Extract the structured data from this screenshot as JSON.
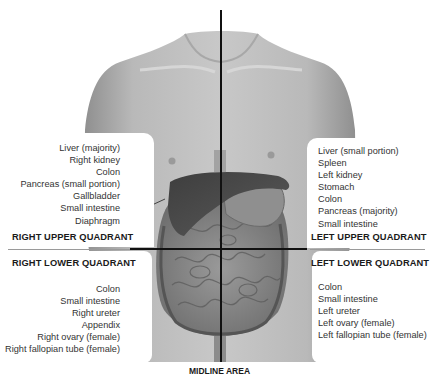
{
  "diagram": {
    "quadrants": [
      {
        "id": "right-upper",
        "title": "RIGHT UPPER QUADRANT",
        "organs": [
          "Liver (majority)",
          "Right kidney",
          "Colon",
          "Pancreas (small portion)",
          "Gallbladder",
          "Small intestine",
          "Diaphragm"
        ]
      },
      {
        "id": "left-upper",
        "title": "LEFT UPPER QUADRANT",
        "organs": [
          "Liver (small portion)",
          "Spleen",
          "Left kidney",
          "Stomach",
          "Colon",
          "Pancreas (majority)",
          "Small intestine"
        ]
      },
      {
        "id": "right-lower",
        "title": "RIGHT LOWER QUADRANT",
        "organs": [
          "Colon",
          "Small intestine",
          "Right ureter",
          "Appendix",
          "Right ovary (female)",
          "Right fallopian tube (female)"
        ]
      },
      {
        "id": "left-lower",
        "title": "LEFT LOWER QUADRANT",
        "organs": [
          "Colon",
          "Small intestine",
          "Left ureter",
          "Left ovary (female)",
          "Left fallopian tube (female)"
        ]
      }
    ],
    "midline_label": "MIDLINE AREA",
    "colors": {
      "skin": "#bdbdbd",
      "skin_shadow": "#9c9c9c",
      "liver": "#4a4a4a",
      "intestine": "#8a8a8a",
      "divider": "#111111",
      "divider_grey": "#9a9a9a"
    }
  }
}
